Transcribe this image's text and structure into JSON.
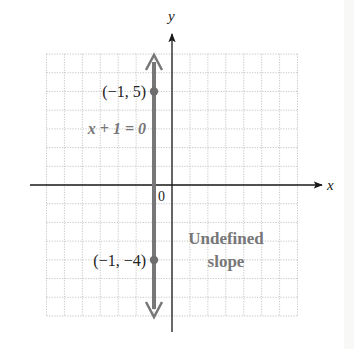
{
  "chart_data": {
    "type": "line",
    "title": "",
    "xlabel": "x",
    "ylabel": "y",
    "origin_label": "0",
    "xlim": [
      -7,
      7
    ],
    "ylim": [
      -7,
      7
    ],
    "grid": true,
    "grid_style": "dotted",
    "series": [
      {
        "name": "x + 1 = 0",
        "kind": "vertical-line",
        "x": -1,
        "arrows": "both",
        "points": [
          {
            "x": -1,
            "y": 5,
            "label": "(−1, 5)"
          },
          {
            "x": -1,
            "y": -4,
            "label": "(−1, −4)"
          }
        ]
      }
    ],
    "annotations": [
      {
        "text": "x + 1 = 0",
        "near": [
          -1,
          3
        ]
      },
      {
        "text": "Undefined",
        "near": [
          2.5,
          -3
        ]
      },
      {
        "text": "slope",
        "near": [
          2.5,
          -4
        ]
      }
    ]
  },
  "labels": {
    "y_axis": "y",
    "x_axis": "x",
    "origin": "0",
    "equation": "x + 1 = 0",
    "point_top": "(−1, 5)",
    "point_bottom": "(−1, −4)",
    "annotation_line1": "Undefined",
    "annotation_line2": "slope"
  },
  "colors": {
    "axis": "#1a1a1a",
    "line": "#777777",
    "point": "#6e6e6e",
    "grid": "#b8b8b8",
    "label_dark": "#222222",
    "label_gray": "#777777"
  }
}
